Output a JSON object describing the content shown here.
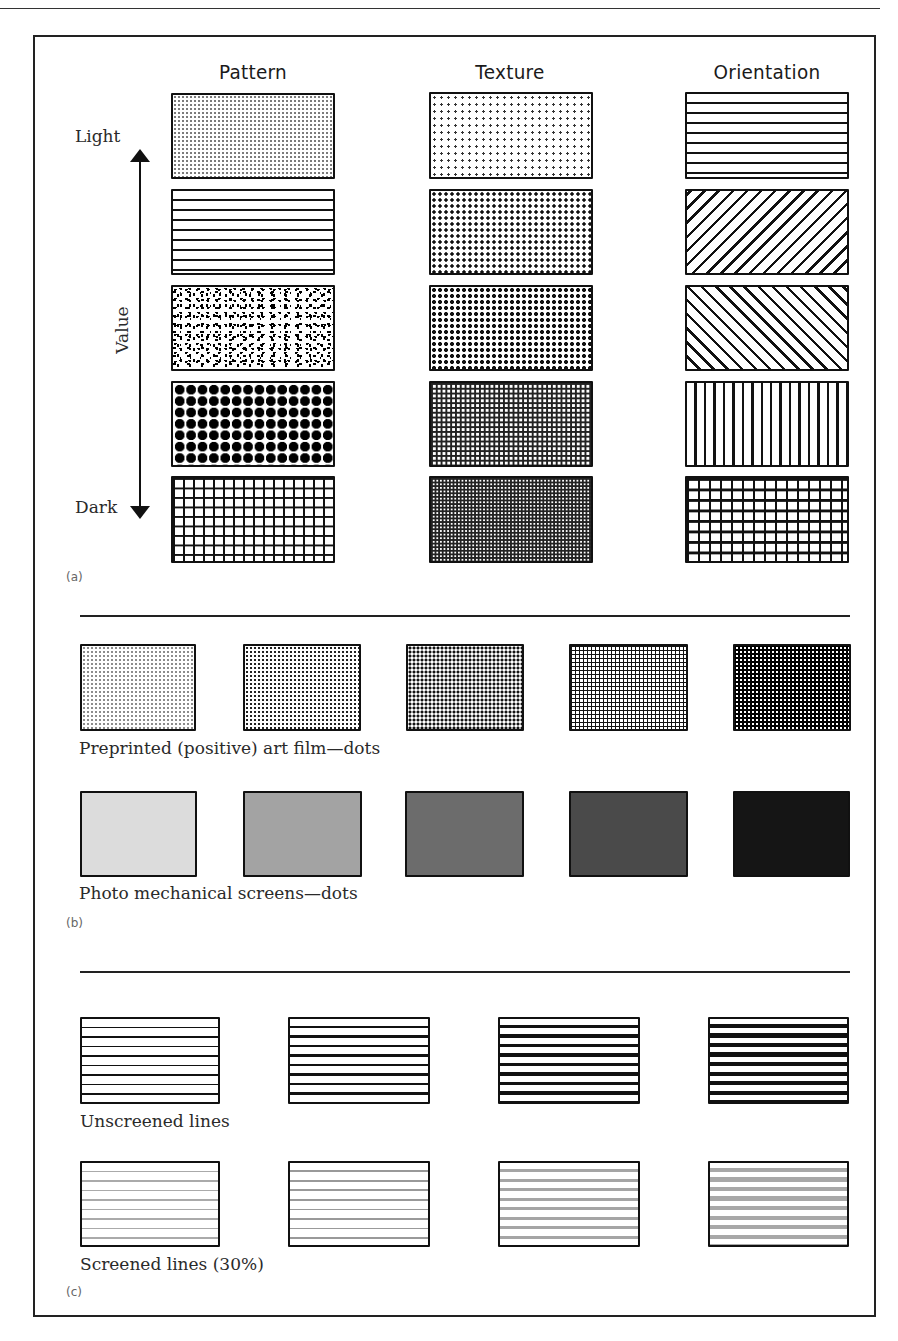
{
  "section_a": {
    "tag": "(a)",
    "columns": [
      "Pattern",
      "Texture",
      "Orientation"
    ],
    "axis": {
      "top_label": "Light",
      "bottom_label": "Dark",
      "axis_label": "Value"
    },
    "rows": [
      {
        "pattern": "fine dots",
        "texture": "sparse small dots",
        "orientation": "horizontal lines"
      },
      {
        "pattern": "horizontal lines",
        "texture": "medium dots",
        "orientation": "diagonal lines (/)"
      },
      {
        "pattern": "random speckle",
        "texture": "dense dots",
        "orientation": "diagonal lines (\\)"
      },
      {
        "pattern": "large dots",
        "texture": "fine grid",
        "orientation": "vertical lines"
      },
      {
        "pattern": "grid",
        "texture": "very fine grid",
        "orientation": "grid"
      }
    ]
  },
  "section_b": {
    "tag": "(b)",
    "art_film": {
      "caption": "Preprinted (positive) art film—dots",
      "levels": [
        1,
        2,
        3,
        4,
        5
      ]
    },
    "photo_screens": {
      "caption": "Photo mechanical screens—dots",
      "colors": [
        "#dcdcdc",
        "#a3a3a3",
        "#6c6c6c",
        "#4a4a4a",
        "#151515"
      ]
    }
  },
  "section_c": {
    "tag": "(c)",
    "unscreened": {
      "caption": "Unscreened lines",
      "levels": [
        1,
        2,
        3,
        4
      ]
    },
    "screened": {
      "caption": "Screened lines (30%)",
      "levels": [
        1,
        2,
        3,
        4
      ]
    }
  }
}
